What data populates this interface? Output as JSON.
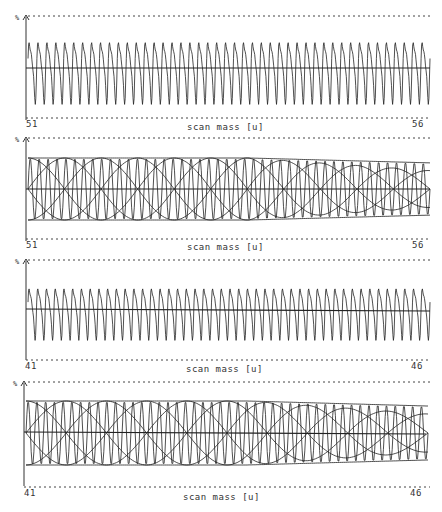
{
  "chart_data": [
    {
      "type": "line",
      "title": "",
      "xlabel": "scan mass [u]",
      "ylabel": "%",
      "x_range": [
        51,
        56
      ],
      "tick_labels": [
        "51",
        "56"
      ],
      "grid": false,
      "legend": null,
      "description": "Measured oscillating signal, ~45 periods, baseline at center",
      "cycles": 45,
      "amplitude": 0.62
    },
    {
      "type": "line",
      "title": "",
      "xlabel": "scan mass [u]",
      "ylabel": "%",
      "x_range": [
        51,
        56
      ],
      "tick_labels": [
        "51",
        "56"
      ],
      "grid": false,
      "legend": null,
      "description": "Reconstructed signal with beating sinusoidal envelopes",
      "cycles": 45,
      "envelope_beats": 5.5
    },
    {
      "type": "line",
      "title": "",
      "xlabel": "scan mass [u]",
      "ylabel": "%",
      "x_range": [
        41,
        46
      ],
      "tick_labels": [
        "41",
        "46"
      ],
      "grid": false,
      "legend": null,
      "description": "Measured oscillating signal, ~46 periods, baseline at center",
      "cycles": 46,
      "amplitude": 0.62
    },
    {
      "type": "line",
      "title": "",
      "xlabel": "scan mass [u]",
      "ylabel": "%",
      "x_range": [
        41,
        46
      ],
      "tick_labels": [
        "41",
        "46"
      ],
      "grid": false,
      "legend": null,
      "description": "Reconstructed signal with beating sinusoidal envelopes",
      "cycles": 46,
      "envelope_beats": 5
    }
  ],
  "panels": [
    {
      "y_label": "%",
      "x_start": "51",
      "x_end": "56",
      "x_title": "scan mass  [u]"
    },
    {
      "y_label": "%",
      "x_start": "51",
      "x_end": "56",
      "x_title": "scan mass  [u]"
    },
    {
      "y_label": "%",
      "x_start": "41",
      "x_end": "46",
      "x_title": "scan mass  [u]"
    },
    {
      "y_label": "%",
      "x_start": "41",
      "x_end": "46",
      "x_title": "scan mass  [u]"
    }
  ]
}
